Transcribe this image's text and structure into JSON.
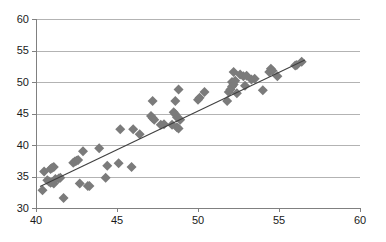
{
  "chart_data": {
    "type": "scatter",
    "title": "",
    "subtitle": "",
    "xlabel": "",
    "ylabel": "",
    "xlim": [
      40,
      60
    ],
    "ylim": [
      30,
      60
    ],
    "xticks": [
      40,
      45,
      50,
      55,
      60
    ],
    "yticks": [
      30,
      35,
      40,
      45,
      50,
      55,
      60
    ],
    "xtick_labels": [
      "40",
      "45",
      "50",
      "55",
      "60"
    ],
    "ytick_labels": [
      "30",
      "35",
      "40",
      "45",
      "50",
      "55",
      "60"
    ],
    "grid": {
      "horizontal": true,
      "vertical": false,
      "color": "#b3b3b3"
    },
    "legend": {
      "visible": false,
      "position": "none"
    },
    "annotations": [],
    "marker": {
      "shape": "diamond",
      "color": "#7b7b7b",
      "size": 5
    },
    "series": [
      {
        "name": "observations",
        "points": [
          [
            40.4,
            32.8
          ],
          [
            40.5,
            35.8
          ],
          [
            40.7,
            34.4
          ],
          [
            40.8,
            34.2
          ],
          [
            40.9,
            34.0
          ],
          [
            40.9,
            36.2
          ],
          [
            41.0,
            34.1
          ],
          [
            41.0,
            36.4
          ],
          [
            41.1,
            33.9
          ],
          [
            41.1,
            36.5
          ],
          [
            41.2,
            34.6
          ],
          [
            41.4,
            34.7
          ],
          [
            41.5,
            34.8
          ],
          [
            41.7,
            31.6
          ],
          [
            42.3,
            37.2
          ],
          [
            42.4,
            37.4
          ],
          [
            42.5,
            37.5
          ],
          [
            42.6,
            37.6
          ],
          [
            42.7,
            33.9
          ],
          [
            42.9,
            39.0
          ],
          [
            43.2,
            33.5
          ],
          [
            43.3,
            33.5
          ],
          [
            43.9,
            39.5
          ],
          [
            44.3,
            34.8
          ],
          [
            44.4,
            36.7
          ],
          [
            45.1,
            37.1
          ],
          [
            45.2,
            42.5
          ],
          [
            45.9,
            36.5
          ],
          [
            46.0,
            42.5
          ],
          [
            46.4,
            41.7
          ],
          [
            47.1,
            44.6
          ],
          [
            47.2,
            44.3
          ],
          [
            47.2,
            47.0
          ],
          [
            47.3,
            44.0
          ],
          [
            47.7,
            43.2
          ],
          [
            47.9,
            43.3
          ],
          [
            48.4,
            43.2
          ],
          [
            48.5,
            45.2
          ],
          [
            48.6,
            44.9
          ],
          [
            48.6,
            47.0
          ],
          [
            48.7,
            44.4
          ],
          [
            48.7,
            42.8
          ],
          [
            48.8,
            42.6
          ],
          [
            48.8,
            48.8
          ],
          [
            48.9,
            44.0
          ],
          [
            50.0,
            47.2
          ],
          [
            50.1,
            47.5
          ],
          [
            50.4,
            48.4
          ],
          [
            51.8,
            47.0
          ],
          [
            51.9,
            48.4
          ],
          [
            52.0,
            48.8
          ],
          [
            52.1,
            49.3
          ],
          [
            52.1,
            50.0
          ],
          [
            52.2,
            49.6
          ],
          [
            52.2,
            51.6
          ],
          [
            52.3,
            50.2
          ],
          [
            52.4,
            48.2
          ],
          [
            52.6,
            51.2
          ],
          [
            52.8,
            50.9
          ],
          [
            52.9,
            49.4
          ],
          [
            53.0,
            51.0
          ],
          [
            53.3,
            50.4
          ],
          [
            53.5,
            50.5
          ],
          [
            54.0,
            48.7
          ],
          [
            54.4,
            51.6
          ],
          [
            54.5,
            52.1
          ],
          [
            54.6,
            51.8
          ],
          [
            54.9,
            50.9
          ],
          [
            56.0,
            52.6
          ],
          [
            56.1,
            52.7
          ],
          [
            56.4,
            53.2
          ]
        ]
      }
    ],
    "trendline": {
      "visible": true,
      "color": "#404040",
      "x_start": 40.25,
      "y_start": 33.4,
      "x_end": 56.6,
      "y_end": 53.5
    }
  }
}
